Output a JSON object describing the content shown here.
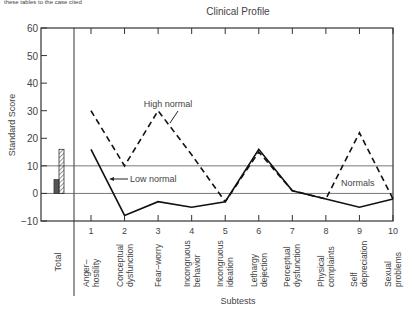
{
  "header": {
    "cutoff_text": "these tables to the case cited"
  },
  "chart_data": {
    "type": "line",
    "title": "Clinical Profile",
    "xlabel": "Subtests",
    "ylabel": "Standard Score",
    "ylim": [
      -10,
      60
    ],
    "yticks": [
      "60",
      "50",
      "40",
      "30",
      "20",
      "10",
      "0",
      "−10"
    ],
    "grid": "horizontal lines at 0 and 10",
    "categories": [
      "1",
      "2",
      "3",
      "4",
      "5",
      "6",
      "7",
      "8",
      "9",
      "10"
    ],
    "category_labels": [
      [
        "Anger–",
        "hostility"
      ],
      [
        "Conceptual",
        "dysfunction"
      ],
      [
        "Fear–worry"
      ],
      [
        "Incongruous",
        "behavior"
      ],
      [
        "Incongruous",
        "ideation"
      ],
      [
        "Lethargy",
        "dejection"
      ],
      [
        "Perceptual",
        "dysfunction"
      ],
      [
        "Physical",
        "complaints"
      ],
      [
        "Self",
        "depreciation"
      ],
      [
        "Sexual",
        "problems"
      ]
    ],
    "total_label": "Total",
    "total_bars": [
      {
        "name": "Low normal total",
        "value": 5,
        "style": "solid"
      },
      {
        "name": "High normal total",
        "value": 16,
        "style": "hatched"
      }
    ],
    "series": [
      {
        "name": "High normal",
        "style": "dashed",
        "values": [
          30,
          10,
          30,
          14,
          -3,
          15,
          1,
          -2,
          22,
          -2
        ]
      },
      {
        "name": "Low normal",
        "style": "solid",
        "values": [
          16,
          -8,
          -3,
          -5,
          -3,
          16,
          1,
          -2,
          -5,
          -2
        ]
      }
    ],
    "annotations": [
      "High normal",
      "Low normal",
      "Normals"
    ]
  }
}
